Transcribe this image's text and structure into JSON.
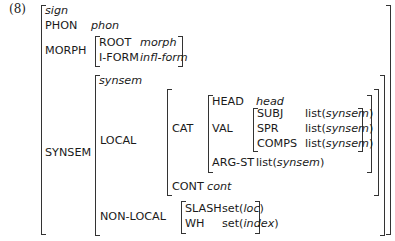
{
  "example_number": "(8)",
  "avm": {
    "type": "sign",
    "phon": {
      "attr": "PHON",
      "value": "phon"
    },
    "morph": {
      "attr": "MORPH",
      "root": {
        "attr": "ROOT",
        "value": "morph"
      },
      "iform": {
        "attr": "I-FORM",
        "value": "infl-form"
      }
    },
    "synsem": {
      "attr": "SYNSEM",
      "type": "synsem",
      "local": {
        "attr": "LOCAL",
        "cat": {
          "attr": "CAT",
          "head": {
            "attr": "HEAD",
            "value": "head"
          },
          "val": {
            "attr": "VAL",
            "subj": {
              "attr": "SUBJ",
              "prefix": "list(",
              "value": "synsem",
              "suffix": ")"
            },
            "spr": {
              "attr": "SPR",
              "prefix": "list(",
              "value": "synsem",
              "suffix": ")"
            },
            "comps": {
              "attr": "COMPS",
              "prefix": "list(",
              "value": "synsem",
              "suffix": ")"
            }
          },
          "argst": {
            "attr": "ARG-ST",
            "prefix": "list(",
            "value": "synsem",
            "suffix": ")"
          }
        },
        "cont": {
          "attr": "CONT",
          "value": "cont"
        }
      },
      "nonlocal": {
        "attr": "NON-LOCAL",
        "slash": {
          "attr": "SLASH",
          "prefix": "set(",
          "value": "loc",
          "suffix": ")"
        },
        "wh": {
          "attr": "WH",
          "prefix": "set(",
          "value": "index",
          "suffix": ")"
        }
      }
    }
  }
}
